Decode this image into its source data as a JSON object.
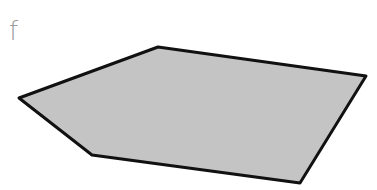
{
  "figure": {
    "label": "f",
    "shape": {
      "type": "pentagon",
      "fill": "#c4c4c4",
      "stroke": "#111111",
      "points": "19,98 158,47 366,76 300,183 92,155"
    }
  }
}
